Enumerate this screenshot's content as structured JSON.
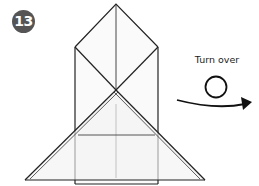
{
  "step": {
    "number": "13",
    "badge_color": "#555555"
  },
  "instruction": {
    "label": "Turn over",
    "icon": "turn-over-loop-arrow-icon"
  },
  "diagram": {
    "line_color": "#222222",
    "paper_fill": "#f7f7f7"
  }
}
